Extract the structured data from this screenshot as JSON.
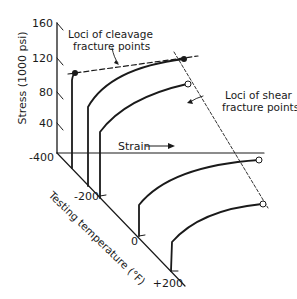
{
  "diagram": {
    "y_axis": {
      "label": "Stress (1000 psi)",
      "ticks": [
        "160",
        "120",
        "80",
        "40"
      ]
    },
    "x_axis": {
      "label": "Strain"
    },
    "z_axis": {
      "label": "Testing temperature (°F)",
      "ticks": [
        "-400",
        "-200",
        "0",
        "+200"
      ]
    },
    "annotations": {
      "cleavage_line1": "Loci of cleavage",
      "cleavage_line2": "fracture points",
      "shear_line1": "Loci of shear",
      "shear_line2": "fracture points"
    },
    "colors": {
      "ink": "#1a1a1a",
      "background": "#ffffff"
    }
  }
}
